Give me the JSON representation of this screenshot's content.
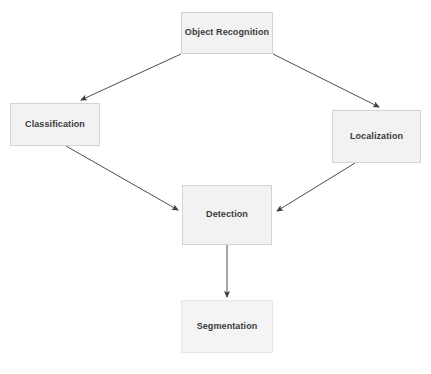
{
  "diagram": {
    "canvas": {
      "width": 431,
      "height": 374,
      "background": "#ffffff"
    },
    "style": {
      "node_fill": "#f2f2f2",
      "node_border": "#d4d4d4",
      "node_text": "#3a3a3a",
      "edge_color": "#4d4d53"
    },
    "nodes": [
      {
        "id": "object-recognition",
        "label": "Object Recognition"
      },
      {
        "id": "classification",
        "label": "Classification"
      },
      {
        "id": "localization",
        "label": "Localization"
      },
      {
        "id": "detection",
        "label": "Detection"
      },
      {
        "id": "segmentation",
        "label": "Segmentation"
      }
    ],
    "edges": [
      {
        "id": "edge-object-recognition-to-classification",
        "from": "Object Recognition",
        "to": "Classification"
      },
      {
        "id": "edge-object-recognition-to-localization",
        "from": "Object Recognition",
        "to": "Localization"
      },
      {
        "id": "edge-classification-to-detection",
        "from": "Classification",
        "to": "Detection"
      },
      {
        "id": "edge-localization-to-detection",
        "from": "Localization",
        "to": "Detection"
      },
      {
        "id": "edge-detection-to-segmentation",
        "from": "Detection",
        "to": "Segmentation"
      }
    ]
  }
}
